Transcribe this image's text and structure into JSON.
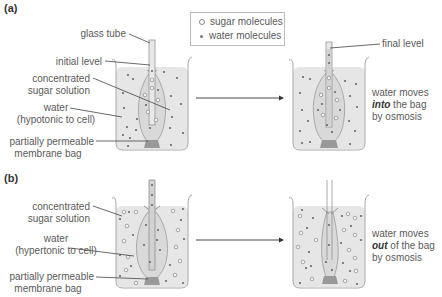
{
  "parts": {
    "a": {
      "label": "(a)",
      "left_labels": {
        "glass_tube": "glass tube",
        "initial_level": "initial level",
        "concentrated_1": "concentrated",
        "concentrated_2": "sugar solution",
        "water_1": "water",
        "water_2": "(hypotonic to cell)",
        "membrane_1": "partially permeable",
        "membrane_2": "membrane bag"
      },
      "right_labels": {
        "final_level": "final level",
        "result_1": "water moves",
        "result_2_em": "into",
        "result_2_rest": " the bag",
        "result_3": "by osmosis"
      }
    },
    "b": {
      "label": "(b)",
      "left_labels": {
        "concentrated_1": "concentrated",
        "concentrated_2": "sugar solution",
        "water_1": "water",
        "water_2": "(hypertonic to cell)",
        "membrane_1": "partially permeable",
        "membrane_2": "membrane bag"
      },
      "right_labels": {
        "result_1": "water moves",
        "result_2_em": "out",
        "result_2_rest": " of the bag",
        "result_3": "by osmosis"
      }
    }
  },
  "legend": {
    "sugar": "sugar molecules",
    "water": "water molecules"
  },
  "colors": {
    "liquid": "#e6e6e6",
    "beaker_outline": "#a8a8a8",
    "bag_fill": "#d8d8d8",
    "text": "#5a5a5a",
    "arrow": "#333333"
  }
}
